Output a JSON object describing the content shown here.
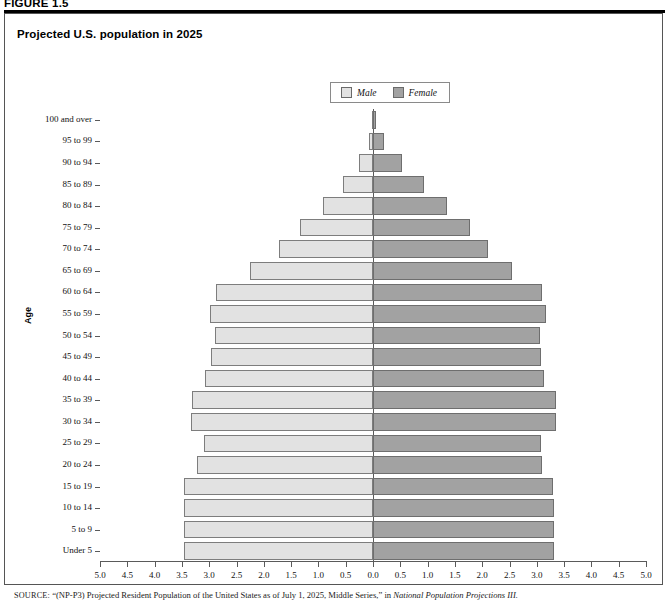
{
  "figure": {
    "label": "FIGURE 1.5",
    "title": "Projected U.S. population in 2025"
  },
  "legend": {
    "position": "top-center",
    "entries": [
      {
        "label": "Male",
        "color": "#e2e2e2",
        "icon": "legend-swatch-male"
      },
      {
        "label": "Female",
        "color": "#a2a2a2",
        "icon": "legend-swatch-female"
      }
    ]
  },
  "source": {
    "kicker": "SOURCE:",
    "text_before": " “(NP-P3) Projected Resident Population of the United States as of July 1, 2025, Middle Series,” in ",
    "italic_title": "National Population Projections III."
  },
  "chart_data": {
    "type": "bar",
    "subtype": "population-pyramid",
    "title": "Projected U.S. population in 2025",
    "xlabel": "Percent",
    "ylabel": "Age",
    "grid": false,
    "orientation": "horizontal-diverging",
    "xlim": [
      -5.0,
      5.0
    ],
    "xtick_labels": [
      "5.0",
      "4.5",
      "4.0",
      "3.5",
      "3.0",
      "2.5",
      "2.0",
      "1.5",
      "1.0",
      "0.5",
      "0.0",
      "0.5",
      "1.0",
      "1.5",
      "2.0",
      "2.5",
      "3.0",
      "3.5",
      "4.0",
      "4.5",
      "5.0"
    ],
    "xtick_values": [
      -5.0,
      -4.5,
      -4.0,
      -3.5,
      -3.0,
      -2.5,
      -2.0,
      -1.5,
      -1.0,
      -0.5,
      0.0,
      0.5,
      1.0,
      1.5,
      2.0,
      2.5,
      3.0,
      3.5,
      4.0,
      4.5,
      5.0
    ],
    "categories": [
      "100 and over",
      "95 to 99",
      "90 to 94",
      "85 to 89",
      "80 to 84",
      "75 to 79",
      "70 to 74",
      "65 to 69",
      "60 to 64",
      "55 to 59",
      "50 to 54",
      "45 to 49",
      "40 to 44",
      "35 to 39",
      "30 to 34",
      "25 to 29",
      "20 to 24",
      "15 to 19",
      "10 to 14",
      "5 to 9",
      "Under 5"
    ],
    "series": [
      {
        "name": "Male",
        "color": "#e2e2e2",
        "side": "left",
        "values": [
          0.02,
          0.08,
          0.26,
          0.55,
          0.92,
          1.33,
          1.72,
          2.25,
          2.87,
          2.99,
          2.9,
          2.97,
          3.07,
          3.32,
          3.33,
          3.1,
          3.22,
          3.46,
          3.47,
          3.47,
          3.47
        ]
      },
      {
        "name": "Female",
        "color": "#a2a2a2",
        "side": "right",
        "values": [
          0.06,
          0.21,
          0.54,
          0.93,
          1.35,
          1.78,
          2.1,
          2.55,
          3.1,
          3.17,
          3.05,
          3.08,
          3.14,
          3.35,
          3.36,
          3.07,
          3.1,
          3.3,
          3.31,
          3.31,
          3.31
        ]
      }
    ]
  }
}
